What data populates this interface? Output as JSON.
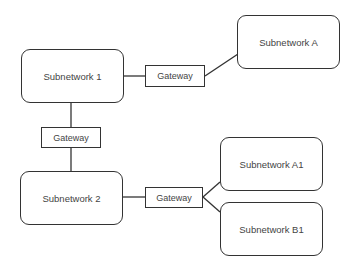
{
  "diagram": {
    "nodes": {
      "subnetwork_1": {
        "label": "Subnetwork 1"
      },
      "subnetwork_a": {
        "label": "Subnetwork A"
      },
      "subnetwork_2": {
        "label": "Subnetwork 2"
      },
      "subnetwork_a1": {
        "label": "Subnetwork A1"
      },
      "subnetwork_b1": {
        "label": "Subnetwork B1"
      },
      "gateway_top": {
        "label": "Gateway"
      },
      "gateway_middle": {
        "label": "Gateway"
      },
      "gateway_bottom": {
        "label": "Gateway"
      }
    },
    "edges": [
      {
        "from": "Subnetwork 1",
        "to": "Gateway (top)"
      },
      {
        "from": "Gateway (top)",
        "to": "Subnetwork A"
      },
      {
        "from": "Subnetwork 1",
        "to": "Gateway (middle)"
      },
      {
        "from": "Gateway (middle)",
        "to": "Subnetwork 2"
      },
      {
        "from": "Subnetwork 2",
        "to": "Gateway (bottom)"
      },
      {
        "from": "Gateway (bottom)",
        "to": "Subnetwork A1"
      },
      {
        "from": "Gateway (bottom)",
        "to": "Subnetwork B1"
      }
    ],
    "colors": {
      "stroke": "#333333",
      "text": "#444444",
      "background": "#ffffff"
    }
  }
}
